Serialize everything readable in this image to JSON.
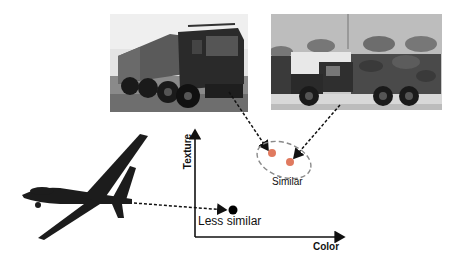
{
  "figure": {
    "images": [
      {
        "name": "military-truck-8x8",
        "description": "Grayscale photo of an 8-wheeled military truck on grass"
      },
      {
        "name": "military-cargo-truck-camouflage",
        "description": "Grayscale photo of a camouflage-covered military cargo truck on a road"
      },
      {
        "name": "uav-drone",
        "description": "Silhouette of an unmanned aerial vehicle (drone) in flight"
      }
    ],
    "axes": {
      "x_label": "Color",
      "y_label": "Texture"
    },
    "annotations": {
      "similar": "Similar",
      "less_similar": "Less similar"
    },
    "colors": {
      "similar_points": "#e07a5f",
      "less_similar_point": "#000000",
      "ellipse": "#8a8a8a",
      "arrows": "#111111"
    }
  }
}
